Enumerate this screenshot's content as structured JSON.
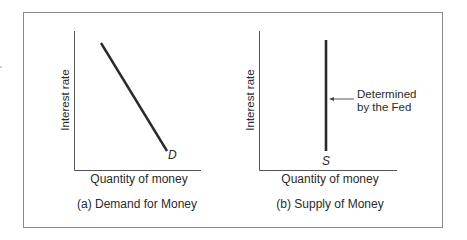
{
  "panels": [
    {
      "id": "a",
      "caption": "(a) Demand for Money",
      "xlabel": "Quantity of money",
      "ylabel": "Interest rate",
      "curve_label": "D",
      "curve_type": "downward-sloping line"
    },
    {
      "id": "b",
      "caption": "(b) Supply of Money",
      "xlabel": "Quantity of money",
      "ylabel": "Interest rate",
      "curve_label": "S",
      "curve_type": "vertical line",
      "annotation": {
        "line1": "Determined",
        "line2": "by the Fed"
      }
    }
  ],
  "colors": {
    "line": "#2a2a2a",
    "axis": "#555555",
    "frame": "#8a8a8a"
  }
}
